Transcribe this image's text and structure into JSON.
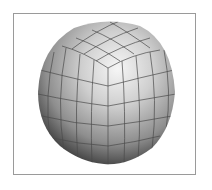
{
  "figure": {
    "subject": "Subdivided cube projected to sphere (quad sphere) with grid lines",
    "colors": {
      "frame": "#9a9a9a",
      "highlight": "#f4f4f4",
      "midtone": "#b8b8b8",
      "shadow": "#2a2a2a",
      "grid": "#4a4a4a",
      "background": "#ffffff"
    },
    "sphere": {
      "cx": 106,
      "cy": 92,
      "r": 69
    },
    "cube_corner": {
      "x": 108,
      "y": 68
    }
  }
}
